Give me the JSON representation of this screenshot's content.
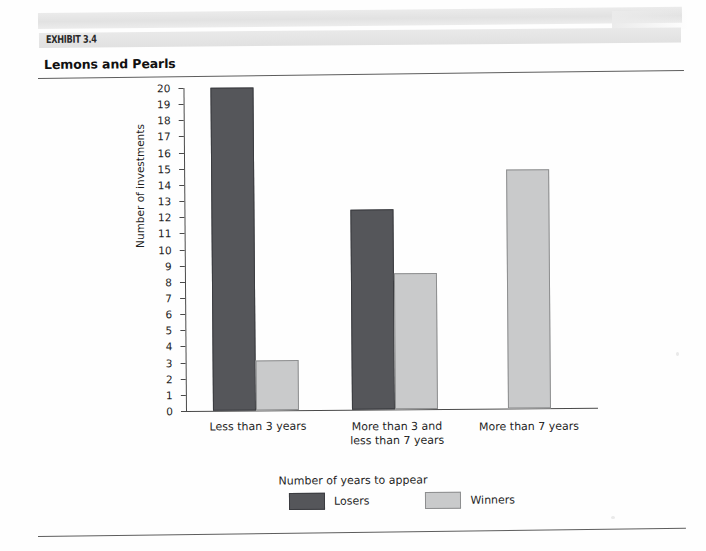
{
  "exhibit": {
    "tag": "EXHIBIT 3.4",
    "title": "Lemons and Pearls"
  },
  "chart_data": {
    "type": "bar",
    "title": "Lemons and Pearls",
    "xlabel": "",
    "ylabel": "Number of investments",
    "ylim": [
      0,
      20
    ],
    "ytick_step": 1,
    "yticks": [
      "20",
      "19",
      "18",
      "17",
      "16",
      "15",
      "14",
      "13",
      "12",
      "11",
      "10",
      "9",
      "8",
      "7",
      "6",
      "5",
      "4",
      "3",
      "2",
      "1",
      "0"
    ],
    "grid": false,
    "legend_position": "bottom",
    "legend_title": "Number of years to appear",
    "categories": [
      "Less than 3 years",
      "More than 3 and\nless than 7 years",
      "More than 7 years"
    ],
    "series": [
      {
        "name": "Losers",
        "color": "#55565a",
        "values": [
          20,
          12.4,
          0
        ]
      },
      {
        "name": "Winners",
        "color": "#c9cacb",
        "values": [
          3.1,
          8.4,
          14.8
        ]
      }
    ]
  }
}
